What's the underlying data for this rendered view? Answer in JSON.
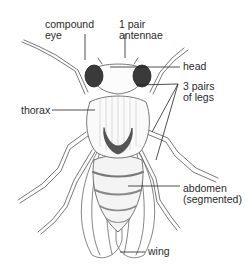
{
  "diagram": {
    "labels": {
      "compound_eye": "compound\neye",
      "antennae": "1 pair\nantennae",
      "head": "head",
      "legs": "3 pairs\nof legs",
      "thorax": "thorax",
      "abdomen": "abdomen\n(segmented)",
      "wing": "wing"
    },
    "colors": {
      "ink": "#2a2a2a",
      "eye": "#3a3a3a",
      "background": "#ffffff"
    }
  }
}
